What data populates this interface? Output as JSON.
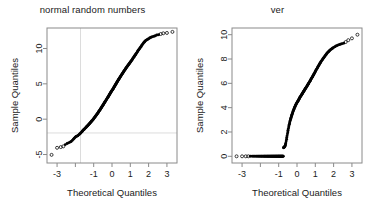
{
  "figure": {
    "background_color": "#ffffff",
    "axis_color": "#8a8a8a",
    "point_color": "#000000",
    "refline_color": "#dcdcdc",
    "layout": "two panels side by side"
  },
  "panels": [
    {
      "id": "left",
      "title": "normal random numbers",
      "xlabel": "Theoretical Quantiles",
      "ylabel": "Sample Quantiles"
    },
    {
      "id": "right",
      "title": "ver",
      "xlabel": "Theoretical Quantiles",
      "ylabel": "Sample Quantiles"
    }
  ],
  "chart_data": [
    {
      "type": "scatter",
      "title": "normal random numbers",
      "xlabel": "Theoretical Quantiles",
      "ylabel": "Sample Quantiles",
      "xlim": [
        -3.55,
        3.55
      ],
      "ylim": [
        -6.2,
        12.9
      ],
      "xticks": [
        -3,
        -2,
        -1,
        0,
        1,
        2,
        3
      ],
      "xtick_labels": [
        "-3",
        "",
        "-1",
        "0",
        "1",
        "2",
        "3"
      ],
      "yticks": [
        -5,
        0,
        5,
        10
      ],
      "ytick_labels": [
        "-5",
        "0",
        "5",
        "10"
      ],
      "grid": false,
      "legend": "none",
      "reference_lines": [
        {
          "orientation": "vertical",
          "value": -1.72,
          "color": "#dcdcdc"
        },
        {
          "orientation": "horizontal",
          "value": -1.95,
          "color": "#dcdcdc"
        }
      ],
      "marker": "open-circle",
      "x": [
        -3.3,
        -3.0,
        -2.8,
        -2.66,
        -2.55,
        -2.45,
        -2.37,
        -2.3,
        -2.23,
        -2.17,
        -2.11,
        -2.06,
        -2.01,
        -1.96,
        -1.92,
        -1.87,
        -1.83,
        -1.79,
        -1.76,
        -1.72,
        -1.69,
        -1.65,
        -1.62,
        -1.59,
        -1.56,
        -1.53,
        -1.5,
        -1.47,
        -1.44,
        -1.41,
        -1.39,
        -1.36,
        -1.33,
        -1.31,
        -1.28,
        -1.26,
        -1.23,
        -1.21,
        -1.19,
        -1.16,
        -1.14,
        -1.12,
        -1.1,
        -1.07,
        -1.05,
        -1.03,
        -1.01,
        -0.99,
        -0.97,
        -0.95,
        -0.93,
        -0.91,
        -0.89,
        -0.87,
        -0.85,
        -0.83,
        -0.81,
        -0.79,
        -0.77,
        -0.75,
        -0.74,
        -0.72,
        -0.7,
        -0.68,
        -0.66,
        -0.64,
        -0.63,
        -0.61,
        -0.59,
        -0.57,
        -0.56,
        -0.54,
        -0.52,
        -0.5,
        -0.49,
        -0.47,
        -0.45,
        -0.44,
        -0.42,
        -0.4,
        -0.39,
        -0.37,
        -0.35,
        -0.34,
        -0.32,
        -0.3,
        -0.29,
        -0.27,
        -0.25,
        -0.24,
        -0.22,
        -0.21,
        -0.19,
        -0.17,
        -0.16,
        -0.14,
        -0.13,
        -0.11,
        -0.09,
        -0.08,
        -0.06,
        -0.05,
        -0.03,
        -0.01,
        0.01,
        0.03,
        0.05,
        0.06,
        0.08,
        0.09,
        0.11,
        0.13,
        0.14,
        0.16,
        0.17,
        0.19,
        0.21,
        0.22,
        0.24,
        0.25,
        0.27,
        0.29,
        0.3,
        0.32,
        0.34,
        0.35,
        0.37,
        0.39,
        0.4,
        0.42,
        0.44,
        0.45,
        0.47,
        0.49,
        0.5,
        0.52,
        0.54,
        0.56,
        0.57,
        0.59,
        0.61,
        0.63,
        0.64,
        0.66,
        0.68,
        0.7,
        0.72,
        0.74,
        0.75,
        0.77,
        0.79,
        0.81,
        0.83,
        0.85,
        0.87,
        0.89,
        0.91,
        0.93,
        0.95,
        0.97,
        0.99,
        1.01,
        1.03,
        1.05,
        1.07,
        1.1,
        1.12,
        1.14,
        1.16,
        1.19,
        1.21,
        1.23,
        1.26,
        1.28,
        1.31,
        1.33,
        1.36,
        1.39,
        1.41,
        1.44,
        1.47,
        1.5,
        1.53,
        1.56,
        1.59,
        1.62,
        1.65,
        1.69,
        1.72,
        1.76,
        1.79,
        1.83,
        1.87,
        1.92,
        1.96,
        2.01,
        2.06,
        2.11,
        2.17,
        2.23,
        2.3,
        2.37,
        2.45,
        2.55,
        2.66,
        2.8,
        3.0,
        3.3
      ],
      "y": [
        -5.05,
        -4.05,
        -3.95,
        -3.85,
        -3.6,
        -3.45,
        -3.35,
        -3.25,
        -3.15,
        -3.0,
        -2.85,
        -2.7,
        -2.55,
        -2.45,
        -2.4,
        -2.35,
        -2.25,
        -2.15,
        -2.1,
        -2.0,
        -1.9,
        -1.8,
        -1.7,
        -1.6,
        -1.52,
        -1.45,
        -1.38,
        -1.3,
        -1.22,
        -1.15,
        -1.08,
        -1.0,
        -0.93,
        -0.86,
        -0.79,
        -0.72,
        -0.65,
        -0.58,
        -0.51,
        -0.44,
        -0.37,
        -0.3,
        -0.24,
        -0.17,
        -0.1,
        -0.03,
        0.04,
        0.11,
        0.18,
        0.25,
        0.32,
        0.39,
        0.46,
        0.53,
        0.6,
        0.67,
        0.74,
        0.81,
        0.88,
        0.95,
        1.02,
        1.09,
        1.16,
        1.23,
        1.3,
        1.37,
        1.44,
        1.51,
        1.58,
        1.65,
        1.72,
        1.79,
        1.86,
        1.93,
        2.0,
        2.07,
        2.14,
        2.21,
        2.28,
        2.35,
        2.42,
        2.49,
        2.56,
        2.63,
        2.7,
        2.77,
        2.84,
        2.91,
        2.98,
        3.05,
        3.12,
        3.19,
        3.26,
        3.33,
        3.4,
        3.47,
        3.54,
        3.61,
        3.68,
        3.75,
        3.82,
        3.89,
        3.96,
        4.03,
        4.1,
        4.17,
        4.24,
        4.31,
        4.38,
        4.45,
        4.52,
        4.59,
        4.66,
        4.73,
        4.8,
        4.87,
        4.94,
        5.01,
        5.08,
        5.15,
        5.22,
        5.29,
        5.36,
        5.43,
        5.5,
        5.57,
        5.64,
        5.71,
        5.78,
        5.85,
        5.92,
        5.99,
        6.06,
        6.13,
        6.2,
        6.27,
        6.34,
        6.41,
        6.48,
        6.55,
        6.62,
        6.69,
        6.76,
        6.83,
        6.9,
        6.97,
        7.04,
        7.11,
        7.18,
        7.25,
        7.32,
        7.39,
        7.46,
        7.53,
        7.6,
        7.67,
        7.74,
        7.81,
        7.88,
        7.95,
        8.02,
        8.09,
        8.16,
        8.23,
        8.32,
        8.41,
        8.5,
        8.59,
        8.68,
        8.77,
        8.86,
        8.95,
        9.04,
        9.13,
        9.22,
        9.31,
        9.42,
        9.53,
        9.64,
        9.75,
        9.86,
        9.97,
        10.08,
        10.19,
        10.3,
        10.42,
        10.54,
        10.66,
        10.78,
        10.9,
        11.0,
        11.1,
        11.18,
        11.25,
        11.32,
        11.4,
        11.48,
        11.56,
        11.62,
        11.68,
        11.74,
        11.8,
        11.9,
        11.95,
        12.05,
        12.15,
        12.2,
        12.35
      ]
    },
    {
      "type": "scatter",
      "title": "ver",
      "xlabel": "Theoretical Quantiles",
      "ylabel": "Sample Quantiles",
      "xlim": [
        -3.55,
        3.55
      ],
      "ylim": [
        -0.55,
        10.55
      ],
      "xticks": [
        -3,
        -2,
        -1,
        0,
        1,
        2,
        3
      ],
      "xtick_labels": [
        "-3",
        "",
        "-1",
        "0",
        "1",
        "2",
        "3"
      ],
      "yticks": [
        0,
        2,
        4,
        6,
        8,
        10
      ],
      "ytick_labels": [
        "0",
        "2",
        "4",
        "6",
        "8",
        "10"
      ],
      "grid": false,
      "legend": "none",
      "reference_lines": [],
      "marker": "open-circle",
      "x": [
        -3.3,
        -3.0,
        -2.8,
        -2.66,
        -2.55,
        -2.45,
        -2.37,
        -2.3,
        -2.23,
        -2.17,
        -2.11,
        -2.06,
        -2.01,
        -1.96,
        -1.92,
        -1.87,
        -1.83,
        -1.79,
        -1.76,
        -1.72,
        -1.69,
        -1.65,
        -1.62,
        -1.59,
        -1.56,
        -1.53,
        -1.5,
        -1.47,
        -1.44,
        -1.41,
        -1.39,
        -1.36,
        -1.33,
        -1.31,
        -1.28,
        -1.26,
        -1.23,
        -1.21,
        -1.19,
        -1.16,
        -1.14,
        -1.12,
        -1.1,
        -1.07,
        -1.05,
        -1.03,
        -1.01,
        -0.99,
        -0.97,
        -0.95,
        -0.93,
        -0.91,
        -0.89,
        -0.87,
        -0.85,
        -0.83,
        -0.81,
        -0.79,
        -0.77,
        -0.75,
        -0.74,
        -0.72,
        -0.7,
        -0.68,
        -0.66,
        -0.64,
        -0.63,
        -0.61,
        -0.59,
        -0.57,
        -0.56,
        -0.54,
        -0.52,
        -0.5,
        -0.49,
        -0.47,
        -0.45,
        -0.44,
        -0.42,
        -0.4,
        -0.39,
        -0.37,
        -0.35,
        -0.34,
        -0.32,
        -0.3,
        -0.29,
        -0.27,
        -0.25,
        -0.24,
        -0.22,
        -0.21,
        -0.19,
        -0.17,
        -0.16,
        -0.14,
        -0.13,
        -0.11,
        -0.09,
        -0.08,
        -0.06,
        -0.05,
        -0.03,
        -0.01,
        0.01,
        0.03,
        0.05,
        0.06,
        0.08,
        0.09,
        0.11,
        0.13,
        0.14,
        0.16,
        0.17,
        0.19,
        0.21,
        0.22,
        0.24,
        0.25,
        0.27,
        0.29,
        0.3,
        0.32,
        0.34,
        0.35,
        0.37,
        0.39,
        0.4,
        0.42,
        0.44,
        0.45,
        0.47,
        0.49,
        0.5,
        0.52,
        0.54,
        0.56,
        0.57,
        0.59,
        0.61,
        0.63,
        0.64,
        0.66,
        0.68,
        0.7,
        0.72,
        0.74,
        0.75,
        0.77,
        0.79,
        0.81,
        0.83,
        0.85,
        0.87,
        0.89,
        0.91,
        0.93,
        0.95,
        0.97,
        0.99,
        1.01,
        1.03,
        1.05,
        1.07,
        1.1,
        1.12,
        1.14,
        1.16,
        1.19,
        1.21,
        1.23,
        1.26,
        1.28,
        1.31,
        1.33,
        1.36,
        1.39,
        1.41,
        1.44,
        1.47,
        1.5,
        1.53,
        1.56,
        1.59,
        1.62,
        1.65,
        1.69,
        1.72,
        1.76,
        1.79,
        1.83,
        1.87,
        1.92,
        1.96,
        2.01,
        2.06,
        2.11,
        2.17,
        2.23,
        2.3,
        2.37,
        2.45,
        2.55,
        2.66,
        2.8,
        3.0,
        3.3
      ],
      "y": [
        0.0,
        0.0,
        0.0,
        0.0,
        0.0,
        0.0,
        0.0,
        0.0,
        0.0,
        0.0,
        0.0,
        0.0,
        0.0,
        0.0,
        0.0,
        0.0,
        0.0,
        0.0,
        0.0,
        0.0,
        0.0,
        0.0,
        0.0,
        0.0,
        0.0,
        0.0,
        0.0,
        0.0,
        0.0,
        0.0,
        0.0,
        0.0,
        0.0,
        0.0,
        0.0,
        0.0,
        0.0,
        0.0,
        0.0,
        0.0,
        0.0,
        0.0,
        0.0,
        0.0,
        0.0,
        0.0,
        0.0,
        0.0,
        0.0,
        0.0,
        0.0,
        0.0,
        0.0,
        0.0,
        0.0,
        0.0,
        0.0,
        0.0,
        0.0,
        0.0,
        0.7,
        0.72,
        0.75,
        0.78,
        0.82,
        0.9,
        1.0,
        1.1,
        1.25,
        1.4,
        1.55,
        1.7,
        1.85,
        2.0,
        2.15,
        2.28,
        2.4,
        2.52,
        2.63,
        2.74,
        2.84,
        2.94,
        3.03,
        3.12,
        3.21,
        3.29,
        3.37,
        3.45,
        3.52,
        3.59,
        3.66,
        3.73,
        3.79,
        3.85,
        3.91,
        3.97,
        4.03,
        4.08,
        4.14,
        4.19,
        4.24,
        4.29,
        4.34,
        4.39,
        4.44,
        4.48,
        4.53,
        4.57,
        4.62,
        4.66,
        4.7,
        4.75,
        4.79,
        4.83,
        4.87,
        4.91,
        4.95,
        4.99,
        5.03,
        5.07,
        5.11,
        5.15,
        5.19,
        5.23,
        5.27,
        5.31,
        5.35,
        5.39,
        5.43,
        5.47,
        5.51,
        5.55,
        5.59,
        5.63,
        5.67,
        5.71,
        5.75,
        5.8,
        5.84,
        5.88,
        5.93,
        5.97,
        6.02,
        6.06,
        6.11,
        6.16,
        6.2,
        6.25,
        6.3,
        6.35,
        6.4,
        6.45,
        6.5,
        6.55,
        6.6,
        6.66,
        6.71,
        6.77,
        6.82,
        6.88,
        6.93,
        6.99,
        7.05,
        7.11,
        7.17,
        7.23,
        7.29,
        7.35,
        7.41,
        7.47,
        7.53,
        7.59,
        7.65,
        7.71,
        7.77,
        7.83,
        7.89,
        7.95,
        8.01,
        8.07,
        8.13,
        8.19,
        8.25,
        8.31,
        8.37,
        8.43,
        8.49,
        8.55,
        8.6,
        8.66,
        8.71,
        8.76,
        8.81,
        8.86,
        8.91,
        8.96,
        9.0,
        9.05,
        9.1,
        9.14,
        9.18,
        9.22,
        9.26,
        9.3,
        9.4,
        9.55,
        9.7,
        10.0
      ]
    }
  ]
}
